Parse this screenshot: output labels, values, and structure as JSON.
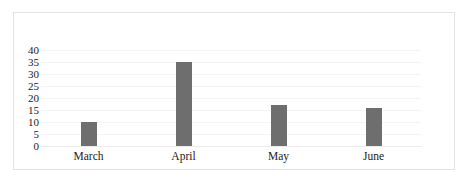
{
  "chart_data": {
    "type": "bar",
    "title": "",
    "subtitle": "",
    "xlabel": "",
    "ylabel": "",
    "categories": [
      "March",
      "April",
      "May",
      "June"
    ],
    "values": [
      10,
      35,
      17,
      16
    ],
    "series": [
      {
        "name": "",
        "values": [
          10,
          35,
          17,
          16
        ],
        "color": "#6e6e6e"
      }
    ],
    "ylim": [
      0,
      40
    ],
    "y_ticks": [
      0,
      5,
      10,
      15,
      20,
      25,
      30,
      35,
      40
    ],
    "y_tick_labels": [
      "0",
      "5",
      "10",
      "15",
      "20",
      "25",
      "30",
      "35",
      "40"
    ],
    "grid": true,
    "grid_axis": "y",
    "legend": false,
    "legend_position": "none",
    "bar_color": "#6e6e6e",
    "grid_color": "#f4f4f4",
    "axis_color": "#eceaea",
    "frame_border_color": "#e3e3e3",
    "background_color": "#ffffff",
    "text_color": "#1b1b1b"
  }
}
